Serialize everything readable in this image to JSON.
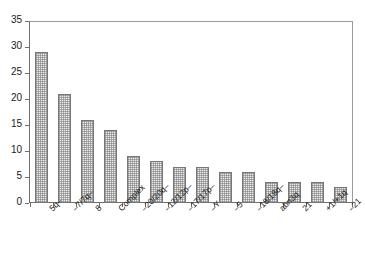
{
  "chart_data": {
    "type": "bar",
    "title": "",
    "subtitle": "",
    "xlabel": "",
    "ylabel": "",
    "ylim": [
      0,
      35
    ],
    "ytick_step": 5,
    "yticks": [
      0,
      5,
      10,
      15,
      20,
      25,
      30,
      35
    ],
    "grid": false,
    "legend": null,
    "legend_position": "none",
    "categories": [
      "5q–",
      "–7/7q–",
      "8",
      "Complex",
      "–20/20q–",
      "–12/12p–",
      "–17/17p–",
      "–Y",
      "–5",
      "–18/18q–",
      "abn3q",
      "21",
      "+1/+1q",
      "–21"
    ],
    "values": [
      29,
      21,
      16,
      14,
      9,
      8,
      7,
      7,
      6,
      6,
      4,
      4,
      4,
      3
    ],
    "series": [
      {
        "name": "",
        "values": [
          29,
          21,
          16,
          14,
          9,
          8,
          7,
          7,
          6,
          6,
          4,
          4,
          4,
          3
        ]
      }
    ],
    "annotations": []
  },
  "style": {
    "bar_fill": "#ececec",
    "bar_border": "#777777",
    "axis_color": "#6e6e6e",
    "frame_color": "#9a9a9a",
    "text_color": "#1a1a1a",
    "background": "#ffffff"
  }
}
